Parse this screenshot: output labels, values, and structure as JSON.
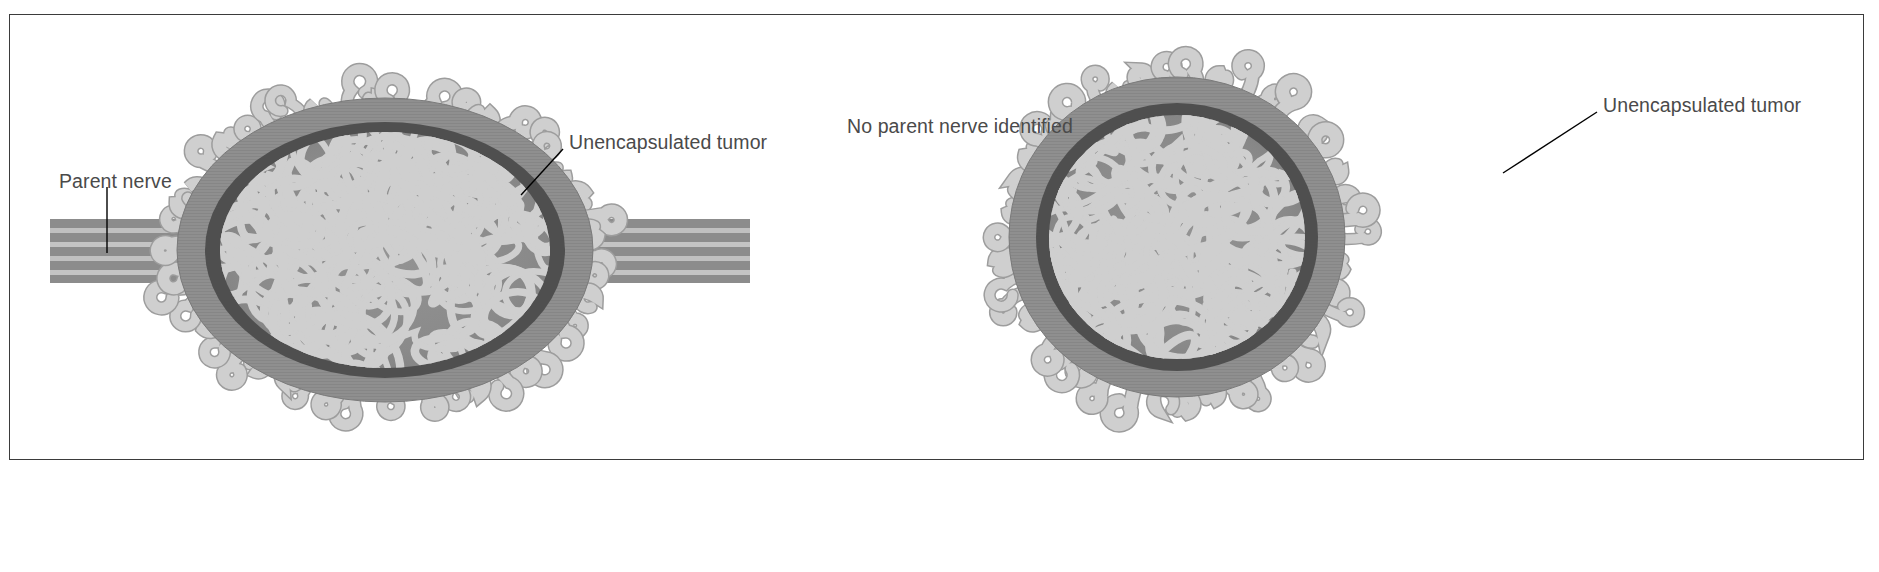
{
  "figure": {
    "domain": "medical-illustration",
    "frame_color": "#3b3b3b",
    "background_color": "#ffffff"
  },
  "palette": {
    "tumor_body": "#8f8f8f",
    "tumor_body_dark": "#7d7d7d",
    "capsule_dark": "#4f4f4f",
    "strand_light": "#cfcfcf",
    "strand_outline": "#9a9a9a",
    "nerve_stripe_dark": "#8c8c8c",
    "nerve_stripe_light": "#c6c6c6",
    "label_text": "#4a4a4a",
    "leader_line": "#000000"
  },
  "panels": [
    {
      "id": "left",
      "name": "tumor-with-parent-nerve",
      "shape": "oval",
      "has_parent_nerve": true,
      "labels": [
        {
          "id": "parent-nerve",
          "text": "Parent nerve",
          "x": 58,
          "y": 170,
          "leader": {
            "x1": 106,
            "y1": 190,
            "x2": 106,
            "y2": 250
          }
        },
        {
          "id": "unencapsulated-tumor-left",
          "text": "Unencapsulated tumor",
          "x": 568,
          "y": 131,
          "leader": {
            "x1": 563,
            "y1": 152,
            "x2": 521,
            "y2": 196
          }
        }
      ]
    },
    {
      "id": "right",
      "name": "tumor-without-parent-nerve",
      "shape": "round",
      "has_parent_nerve": false,
      "labels": [
        {
          "id": "no-parent-nerve",
          "text": "No parent nerve identified",
          "x": 828,
          "y": 95,
          "leader": null
        },
        {
          "id": "unencapsulated-tumor-right",
          "text": "Unencapsulated tumor",
          "x": 1597,
          "y": 93,
          "leader": {
            "x1": 1592,
            "y1": 114,
            "x2": 1498,
            "y2": 175
          }
        }
      ]
    }
  ]
}
